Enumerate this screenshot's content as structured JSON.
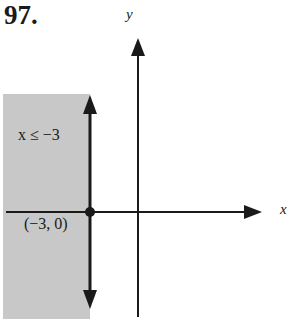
{
  "problem": {
    "number": "97."
  },
  "axes": {
    "x_label": "x",
    "y_label": "y"
  },
  "region": {
    "label": "x ≤ −3",
    "fill": "#c8c8c8"
  },
  "boundary": {
    "equation": "x = −3",
    "style": "solid"
  },
  "point": {
    "label": "(−3, 0)"
  },
  "colors": {
    "ink": "#1a1a1a",
    "shade": "#c8c8c8"
  }
}
